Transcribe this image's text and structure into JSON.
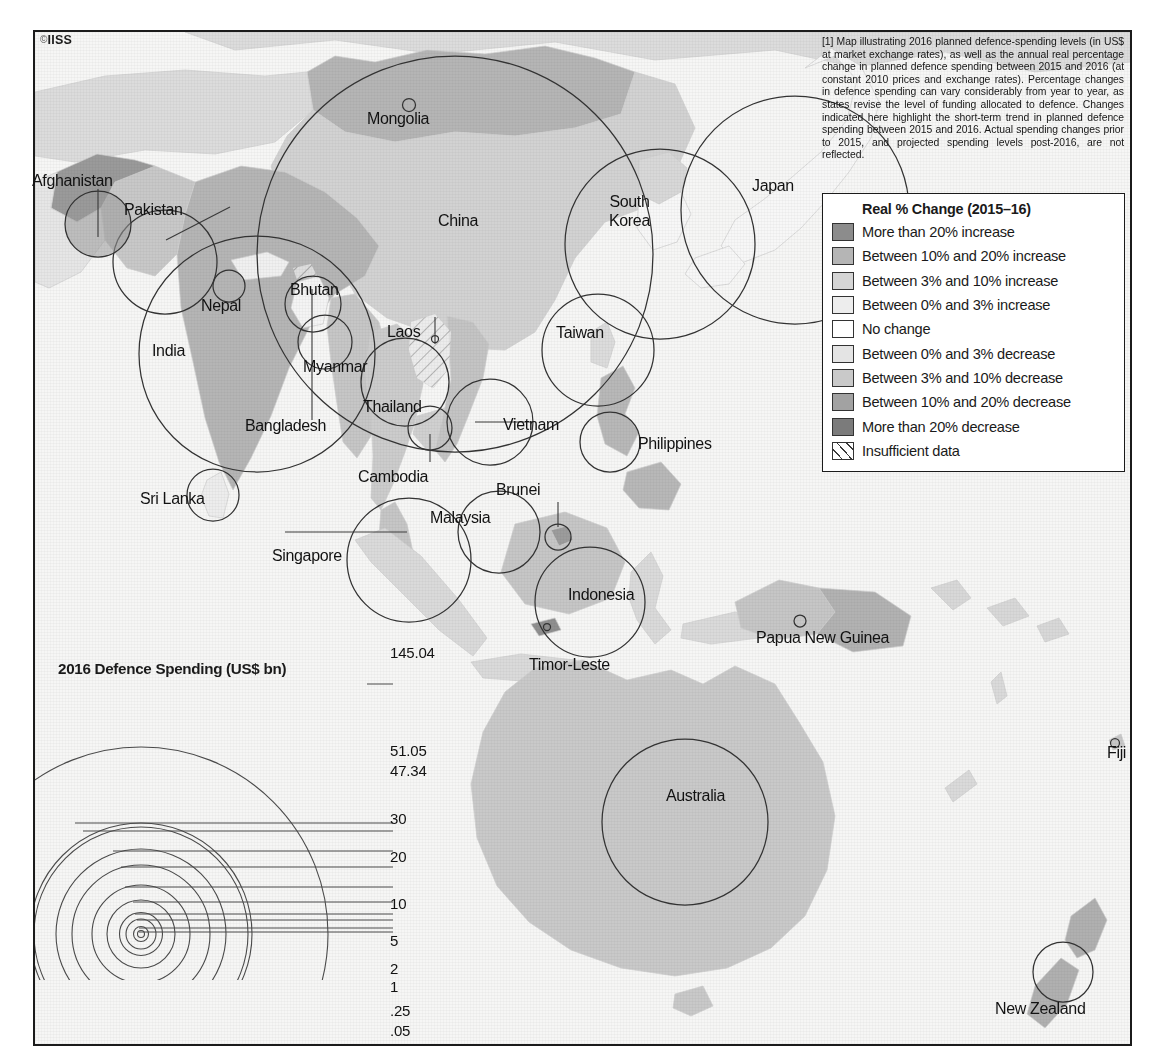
{
  "credit": {
    "mark": "©",
    "text": "IISS"
  },
  "note": {
    "text": "[1] Map illustrating 2016 planned defence-spending levels (in US$ at market exchange rates), as well as the annual real percentage change in planned defence spending between 2015 and 2016 (at constant 2010 prices and exchange rates). Percentage changes in defence spending can vary considerably from year to year, as states revise the level of funding allocated to defence. Changes indicated here highlight the short-term trend in planned defence spending between 2015 and 2016. Actual spending changes prior to 2015, and projected spending levels post-2016, are not reflected."
  },
  "legend": {
    "title": "Real % Change (2015–16)",
    "items": [
      {
        "label": "More than 20% increase",
        "color": "#8c8c8c",
        "pattern": "solid"
      },
      {
        "label": "Between 10% and 20% increase",
        "color": "#b5b5b5",
        "pattern": "solid"
      },
      {
        "label": "Between 3% and 10% increase",
        "color": "#d5d5d5",
        "pattern": "solid"
      },
      {
        "label": "Between 0% and 3% increase",
        "color": "#ededed",
        "pattern": "solid"
      },
      {
        "label": "No change",
        "color": "#ffffff",
        "pattern": "solid"
      },
      {
        "label": "Between 0% and 3% decrease",
        "color": "#e4e4e4",
        "pattern": "solid"
      },
      {
        "label": "Between 3% and 10% decrease",
        "color": "#c9c9c9",
        "pattern": "solid"
      },
      {
        "label": "Between 10% and 20% decrease",
        "color": "#a2a2a2",
        "pattern": "solid"
      },
      {
        "label": "More than 20% decrease",
        "color": "#7b7b7b",
        "pattern": "solid"
      },
      {
        "label": "Insufficient data",
        "color": "#ffffff",
        "pattern": "hatch"
      }
    ]
  },
  "scale_key": {
    "title": "2016 Defence Spending (US$ bn)",
    "values": [
      "145.04",
      "51.05",
      "47.34",
      "30",
      "20",
      "10",
      "5",
      "2",
      "1",
      ".25",
      ".05"
    ]
  },
  "map": {
    "country_labels": [
      {
        "name": "Afghanistan",
        "text": "Afghanistan"
      },
      {
        "name": "Pakistan",
        "text": "Pakistan"
      },
      {
        "name": "Nepal",
        "text": "Nepal"
      },
      {
        "name": "Bhutan",
        "text": "Bhutan"
      },
      {
        "name": "India",
        "text": "India"
      },
      {
        "name": "Bangladesh",
        "text": "Bangladesh"
      },
      {
        "name": "Sri Lanka",
        "text": "Sri Lanka"
      },
      {
        "name": "Mongolia",
        "text": "Mongolia"
      },
      {
        "name": "China",
        "text": "China"
      },
      {
        "name": "South Korea",
        "text": "South\nKorea"
      },
      {
        "name": "Japan",
        "text": "Japan"
      },
      {
        "name": "Taiwan",
        "text": "Taiwan"
      },
      {
        "name": "Myanmar",
        "text": "Myanmar"
      },
      {
        "name": "Laos",
        "text": "Laos"
      },
      {
        "name": "Thailand",
        "text": "Thailand"
      },
      {
        "name": "Cambodia",
        "text": "Cambodia"
      },
      {
        "name": "Vietnam",
        "text": "Vietnam"
      },
      {
        "name": "Philippines",
        "text": "Philippines"
      },
      {
        "name": "Malaysia",
        "text": "Malaysia"
      },
      {
        "name": "Brunei",
        "text": "Brunei"
      },
      {
        "name": "Singapore",
        "text": "Singapore"
      },
      {
        "name": "Indonesia",
        "text": "Indonesia"
      },
      {
        "name": "Timor-Leste",
        "text": "Timor-Leste"
      },
      {
        "name": "Papua New Guinea",
        "text": "Papua New Guinea"
      },
      {
        "name": "Fiji",
        "text": "Fiji"
      },
      {
        "name": "Australia",
        "text": "Australia"
      },
      {
        "name": "New Zealand",
        "text": "New Zealand"
      }
    ]
  },
  "chart_data": {
    "type": "map",
    "title": "2016 Defence Spending (US$ bn)",
    "subtitle": "Real % Change (2015–16)",
    "size_encoding": "circle area proportional to 2016 defence spending in US$ bn",
    "color_encoding": "country fill shade = annual real % change in planned defence spending 2015–16",
    "scale_ticks": [
      145.04,
      51.05,
      47.34,
      30,
      20,
      10,
      5,
      2,
      1,
      0.25,
      0.05
    ],
    "countries": [
      {
        "country": "China",
        "spending_usd_bn": 145.04,
        "change_band": "Between 3% and 10% increase"
      },
      {
        "country": "India",
        "spending_usd_bn": 51.05,
        "change_band": "Between 10% and 20% increase"
      },
      {
        "country": "Japan",
        "spending_usd_bn": 47.34,
        "change_band": "Between 0% and 3% increase"
      },
      {
        "country": "South Korea",
        "spending_usd_bn": 33.0,
        "change_band": "Between 0% and 3% increase"
      },
      {
        "country": "Australia",
        "spending_usd_bn": 24.2,
        "change_band": "Between 3% and 10% increase"
      },
      {
        "country": "Taiwan",
        "spending_usd_bn": 10.3,
        "change_band": "Between 0% and 3% increase"
      },
      {
        "country": "Indonesia",
        "spending_usd_bn": 7.7,
        "change_band": "Between 3% and 10% increase"
      },
      {
        "country": "Singapore",
        "spending_usd_bn": 9.9,
        "change_band": "Between 0% and 3% increase"
      },
      {
        "country": "Pakistan",
        "spending_usd_bn": 9.0,
        "change_band": "Between 10% and 20% increase"
      },
      {
        "country": "Thailand",
        "spending_usd_bn": 5.9,
        "change_band": "Between 3% and 10% increase"
      },
      {
        "country": "Malaysia",
        "spending_usd_bn": 4.5,
        "change_band": "Between 0% and 3% decrease"
      },
      {
        "country": "Vietnam",
        "spending_usd_bn": 5.0,
        "change_band": "Between 3% and 10% increase"
      },
      {
        "country": "Philippines",
        "spending_usd_bn": 2.6,
        "change_band": "Between 3% and 10% increase"
      },
      {
        "country": "New Zealand",
        "spending_usd_bn": 2.1,
        "change_band": "Between 0% and 3% increase"
      },
      {
        "country": "Bangladesh",
        "spending_usd_bn": 1.9,
        "change_band": "Between 3% and 10% increase"
      },
      {
        "country": "Afghanistan",
        "spending_usd_bn": 2.0,
        "change_band": "More than 20% increase"
      },
      {
        "country": "Myanmar",
        "spending_usd_bn": 2.3,
        "change_band": "Between 3% and 10% decrease"
      },
      {
        "country": "Sri Lanka",
        "spending_usd_bn": 1.7,
        "change_band": "Between 0% and 3% increase"
      },
      {
        "country": "Brunei",
        "spending_usd_bn": 0.4,
        "change_band": "Between 10% and 20% decrease"
      },
      {
        "country": "Cambodia",
        "spending_usd_bn": 0.4,
        "change_band": "Between 3% and 10% increase"
      },
      {
        "country": "Nepal",
        "spending_usd_bn": 0.34,
        "change_band": "No change"
      },
      {
        "country": "Papua New Guinea",
        "spending_usd_bn": 0.08,
        "change_band": "Between 10% and 20% increase"
      },
      {
        "country": "Mongolia",
        "spending_usd_bn": 0.08,
        "change_band": "Between 10% and 20% increase"
      },
      {
        "country": "Laos",
        "spending_usd_bn": 0.03,
        "change_band": "Insufficient data"
      },
      {
        "country": "Timor-Leste",
        "spending_usd_bn": 0.03,
        "change_band": "Between 3% and 10% increase"
      },
      {
        "country": "Fiji",
        "spending_usd_bn": 0.06,
        "change_band": "Between 3% and 10% increase"
      },
      {
        "country": "Bhutan",
        "spending_usd_bn": 0.0,
        "change_band": "Insufficient data"
      }
    ]
  }
}
